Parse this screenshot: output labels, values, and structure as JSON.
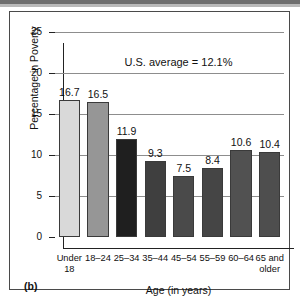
{
  "figure": {
    "panel_letter": "(b)",
    "annotation": "U.S. average = 12.1%"
  },
  "chart_data": {
    "type": "bar",
    "title": "",
    "xlabel": "Age (in years)",
    "ylabel": "Percentage in Poverty",
    "ylim": [
      0,
      25
    ],
    "ytick_labels": [
      "0",
      "5",
      "10",
      "15",
      "20",
      "25"
    ],
    "yticks": [
      0,
      5,
      10,
      15,
      20,
      25
    ],
    "grid": "horizontal",
    "legend": "none",
    "annotations": [
      "U.S. average = 12.1%"
    ],
    "us_average": 12.1,
    "categories": [
      "Under 18",
      "18–24",
      "25–34",
      "35–44",
      "45–54",
      "55–59",
      "60–64",
      "65 and older"
    ],
    "category_lines": [
      [
        "Under",
        "18"
      ],
      [
        "18–24"
      ],
      [
        "25–34"
      ],
      [
        "35–44"
      ],
      [
        "45–54"
      ],
      [
        "55–59"
      ],
      [
        "60–64"
      ],
      [
        "65 and",
        "older"
      ]
    ],
    "values": [
      16.7,
      16.5,
      11.9,
      9.3,
      7.5,
      8.4,
      10.6,
      10.4
    ],
    "value_labels": [
      "16.7",
      "16.5",
      "11.9",
      "9.3",
      "7.5",
      "8.4",
      "10.6",
      "10.4"
    ],
    "bar_colors": [
      "#d9d9d9",
      "#969696",
      "#1f1f1f",
      "#3f3f3f",
      "#4a4a4a",
      "#454545",
      "#515151",
      "#4e4e4e"
    ]
  }
}
